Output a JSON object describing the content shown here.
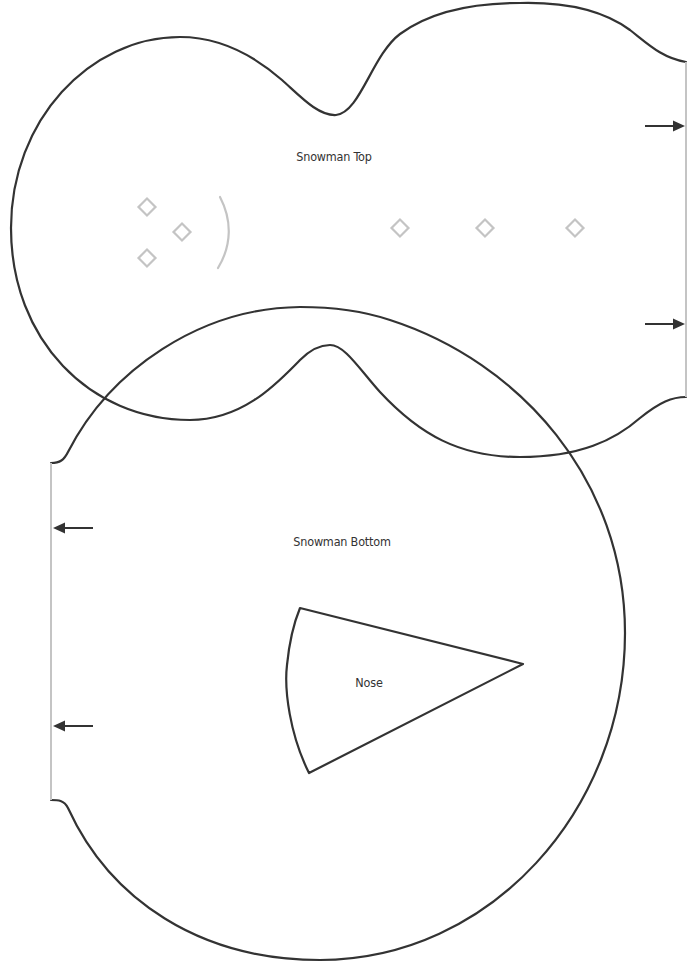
{
  "template": {
    "pieces": [
      {
        "id": "snowman-top",
        "label": "Snowman Top",
        "label_pos": {
          "x": 334,
          "y": 149
        },
        "fold_edge": "right",
        "fold_arrows": 2,
        "face_guides": {
          "eyes_and_mouth_diamonds": 3,
          "mouth_arc": 1,
          "button_diamonds": 3
        }
      },
      {
        "id": "snowman-bottom",
        "label": "Snowman Bottom",
        "label_pos": {
          "x": 342,
          "y": 534
        },
        "fold_edge": "left",
        "fold_arrows": 2
      },
      {
        "id": "nose",
        "label": "Nose",
        "label_pos": {
          "x": 369,
          "y": 675
        }
      }
    ],
    "colors": {
      "cut_line": "#333333",
      "fold_line": "#c4c4c4",
      "guide_marks": "#c4c4c4",
      "label_text": "#333333",
      "background": "#ffffff"
    }
  }
}
